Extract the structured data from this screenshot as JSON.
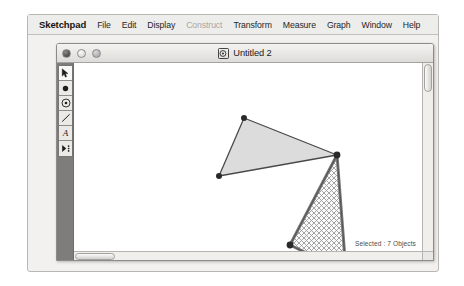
{
  "app": {
    "name": "Sketchpad"
  },
  "menubar": {
    "items": [
      {
        "label": "Sketchpad",
        "disabled": false,
        "app": true
      },
      {
        "label": "File",
        "disabled": false
      },
      {
        "label": "Edit",
        "disabled": false
      },
      {
        "label": "Display",
        "disabled": false
      },
      {
        "label": "Construct",
        "disabled": true
      },
      {
        "label": "Transform",
        "disabled": false
      },
      {
        "label": "Measure",
        "disabled": false
      },
      {
        "label": "Graph",
        "disabled": false
      },
      {
        "label": "Window",
        "disabled": false
      },
      {
        "label": "Help",
        "disabled": false
      }
    ]
  },
  "window": {
    "title": "Untitled 2",
    "doc_icon": "compass-document-icon",
    "controls": [
      {
        "name": "close",
        "icon": "close-button"
      },
      {
        "name": "minimize",
        "icon": "minimize-button"
      },
      {
        "name": "maximize",
        "icon": "maximize-button"
      }
    ]
  },
  "toolbar": {
    "tools": [
      {
        "id": "arrow",
        "icon": "arrow-select-icon",
        "label": "Selection Arrow Tool",
        "active": true
      },
      {
        "id": "point",
        "icon": "point-icon",
        "label": "Point Tool",
        "active": false
      },
      {
        "id": "compass",
        "icon": "compass-circle-icon",
        "label": "Compass Tool",
        "active": false
      },
      {
        "id": "straightedge",
        "icon": "line-segment-icon",
        "label": "Straightedge Tool",
        "active": false
      },
      {
        "id": "text",
        "icon": "text-a-icon",
        "label": "Text Tool",
        "active": false
      },
      {
        "id": "custom",
        "icon": "custom-tool-icon",
        "label": "Custom Tool",
        "active": false
      }
    ]
  },
  "canvas": {
    "status": "Selected : 7 Objects",
    "shapes": [
      {
        "id": "triangle-upper",
        "name": "upper-triangle",
        "fill": "#dcdcdc",
        "stroke": "#4a4a4a",
        "selected": false,
        "points": "170,55 145,113 263,92"
      },
      {
        "id": "triangle-lower",
        "name": "lower-triangle-selected",
        "fill": "hatch",
        "stroke": "#6e6e6e",
        "selected": true,
        "points": "263,92 216,182 272,209"
      }
    ],
    "vertices": [
      {
        "name": "vertex-a",
        "x": 170,
        "y": 55
      },
      {
        "name": "vertex-b",
        "x": 145,
        "y": 113
      },
      {
        "name": "vertex-c",
        "x": 263,
        "y": 92
      },
      {
        "name": "vertex-d",
        "x": 216,
        "y": 182
      },
      {
        "name": "vertex-e",
        "x": 272,
        "y": 209
      }
    ]
  },
  "colors": {
    "menubar_bg": "#ededeb",
    "desktop_bg": "#f2f1ef",
    "toolcol_bg": "#7e7d7b",
    "canvas_bg": "#ffffff",
    "shape_fill": "#dcdcdc",
    "shape_stroke": "#4a4a4a"
  }
}
